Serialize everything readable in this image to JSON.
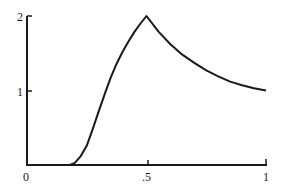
{
  "chart_data": {
    "type": "line",
    "title": "",
    "xlabel": "",
    "ylabel": "",
    "xlim": [
      0,
      1
    ],
    "ylim": [
      0,
      2
    ],
    "grid": false,
    "legend": null,
    "x_ticks": [
      "0",
      ".5",
      "1"
    ],
    "y_ticks": [
      "1",
      "2"
    ],
    "series": [
      {
        "name": "curve",
        "x": [
          0,
          0.1,
          0.15,
          0.18,
          0.2,
          0.225,
          0.25,
          0.275,
          0.3,
          0.325,
          0.35,
          0.375,
          0.4,
          0.425,
          0.45,
          0.475,
          0.5,
          0.55,
          0.6,
          0.65,
          0.7,
          0.75,
          0.8,
          0.85,
          0.9,
          0.95,
          1.0
        ],
        "values": [
          0,
          0,
          0,
          0,
          0.03,
          0.12,
          0.26,
          0.48,
          0.72,
          0.95,
          1.17,
          1.36,
          1.52,
          1.66,
          1.79,
          1.9,
          2.0,
          1.79,
          1.62,
          1.48,
          1.37,
          1.27,
          1.19,
          1.12,
          1.07,
          1.03,
          1.0
        ]
      }
    ],
    "annotations": []
  },
  "labels": {
    "x0": "0",
    "x05": ".5",
    "x1": "1",
    "y1": "1",
    "y2": "2"
  },
  "colors": {
    "line": "#1a1a1a",
    "background": "#ffffff"
  }
}
